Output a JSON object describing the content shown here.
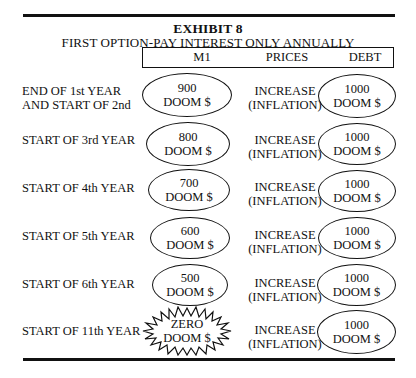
{
  "exhibit": {
    "title": "EXHIBIT 8",
    "subtitle": "FIRST OPTION-PAY INTEREST ONLY ANNUALLY"
  },
  "columns": [
    "M1",
    "PRICES",
    "DEBT"
  ],
  "rows": [
    {
      "label_line1": "END OF 1st YEAR",
      "label_line2": "AND START OF 2nd",
      "m1_value": "900",
      "m1_unit": "DOOM $",
      "m1_shape": "ellipse",
      "prices_line1": "INCREASE",
      "prices_line2": "(INFLATION)",
      "debt_value": "1000",
      "debt_unit": "DOOM $"
    },
    {
      "label_line1": "START OF 3rd YEAR",
      "label_line2": "",
      "m1_value": "800",
      "m1_unit": "DOOM $",
      "m1_shape": "ellipse",
      "prices_line1": "INCREASE",
      "prices_line2": "(INFLATION)",
      "debt_value": "1000",
      "debt_unit": "DOOM $"
    },
    {
      "label_line1": "START OF 4th YEAR",
      "label_line2": "",
      "m1_value": "700",
      "m1_unit": "DOOM $",
      "m1_shape": "ellipse",
      "prices_line1": "INCREASE",
      "prices_line2": "(INFLATION)",
      "debt_value": "1000",
      "debt_unit": "DOOM $"
    },
    {
      "label_line1": "START OF 5th YEAR",
      "label_line2": "",
      "m1_value": "600",
      "m1_unit": "DOOM $",
      "m1_shape": "ellipse",
      "prices_line1": "INCREASE",
      "prices_line2": "(INFLATION)",
      "debt_value": "1000",
      "debt_unit": "DOOM $"
    },
    {
      "label_line1": "START OF 6th YEAR",
      "label_line2": "",
      "m1_value": "500",
      "m1_unit": "DOOM $",
      "m1_shape": "ellipse",
      "prices_line1": "INCREASE",
      "prices_line2": "(INFLATION)",
      "debt_value": "1000",
      "debt_unit": "DOOM $"
    },
    {
      "label_line1": "START OF 11th YEAR",
      "label_line2": "",
      "m1_value": "ZERO",
      "m1_unit": "DOOM $",
      "m1_shape": "starburst",
      "prices_line1": "INCREASE",
      "prices_line2": "(INFLATION)",
      "debt_value": "1000",
      "debt_unit": "DOOM $"
    }
  ]
}
